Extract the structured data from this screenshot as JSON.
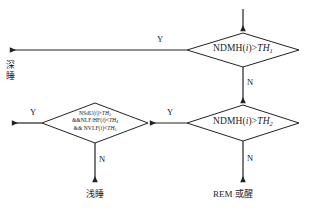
{
  "diagram": {
    "type": "flowchart",
    "nodes": [
      {
        "id": "decision-1",
        "shape": "diamond",
        "text": "NDMH(i)>TH1",
        "text_parts": {
          "prefix": "NDMH(",
          "index": "i",
          "operator": ")>",
          "threshold": "TH",
          "threshold_sub": "1"
        }
      },
      {
        "id": "decision-2",
        "shape": "diamond",
        "text": "NDMH(i)>TH2",
        "text_parts": {
          "prefix": "NDMH(",
          "index": "i",
          "operator": ")>",
          "threshold": "TH",
          "threshold_sub": "2"
        }
      },
      {
        "id": "decision-3",
        "shape": "diamond",
        "lines": [
          {
            "a": "NSdU(",
            "i": "i",
            "b": ")>",
            "th": "TH",
            "sub": "3"
          },
          {
            "a": "&&NLF/HF(",
            "i": "i",
            "b": ")<",
            "th": "TH",
            "sub": "4"
          },
          {
            "a": "&& NVLF(",
            "i": "i",
            "b": ")<",
            "th": "TH",
            "sub": "5"
          }
        ]
      }
    ],
    "terminals": {
      "deep_sleep": "深睡",
      "light_sleep": "浅睡",
      "rem_or_awake": "REM 或醒"
    },
    "branch_labels": {
      "d1_yes": "Y",
      "d1_no": "N",
      "d2_yes": "Y",
      "d2_no": "N",
      "d3_yes": "Y",
      "d3_no": "N"
    },
    "colors": {
      "stroke": "#222222",
      "background": "#ffffff",
      "text": "#1a1a1a"
    }
  }
}
